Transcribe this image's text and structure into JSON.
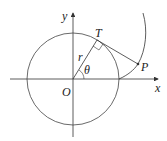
{
  "diagram": {
    "labels": {
      "y_axis": "y",
      "x_axis": "x",
      "origin": "O",
      "tangent_point": "T",
      "curve_point": "P",
      "radius": "r",
      "angle": "θ"
    },
    "colors": {
      "stroke": "#333333",
      "text": "#222222"
    }
  }
}
